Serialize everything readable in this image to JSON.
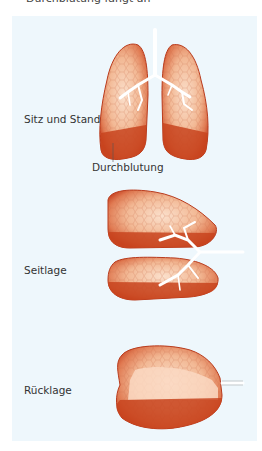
{
  "caption_top": "Durchblutung fängt an",
  "panel": {
    "background": "#eef7fc",
    "figures": [
      {
        "id": "sitz-und-stand",
        "label": "Sitz und Stand",
        "annotation": "Durchblutung"
      },
      {
        "id": "seitlage",
        "label": "Seitlage"
      },
      {
        "id": "ruecklage",
        "label": "Rücklage"
      }
    ]
  },
  "colors": {
    "lung_dark": "#c8401f",
    "lung_mid": "#e07a52",
    "lung_light": "#f7cdb2",
    "lung_perfused": "#c4401f",
    "airway": "#ffffff"
  }
}
